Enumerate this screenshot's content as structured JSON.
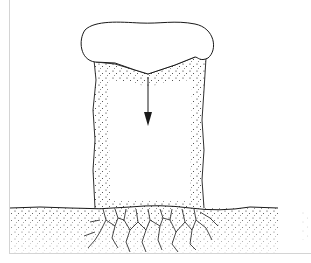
{
  "figure": {
    "labels": [],
    "colors": {
      "ink": "#1a1a1a",
      "frame": "#d4d4d4",
      "background": "#ffffff"
    },
    "elements": {
      "cap": "rounded-cap",
      "column": "stippled-column",
      "arrow": "downward-force-arrow",
      "ground": "stippled-ground",
      "cracks": "crack-network"
    }
  }
}
